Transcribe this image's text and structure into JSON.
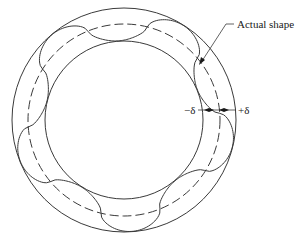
{
  "diagram": {
    "labels": {
      "actual_shape": "Actual shape",
      "minus_delta": "−δ",
      "plus_delta": "+δ"
    },
    "geometry": {
      "center": [
        124,
        120
      ],
      "outer_radius": 112,
      "mean_radius": 96,
      "inner_radius": 79,
      "lobes": 5
    },
    "colors": {
      "stroke": "#3a3a3a",
      "text": "#1a1a1a",
      "background": "#ffffff"
    }
  }
}
